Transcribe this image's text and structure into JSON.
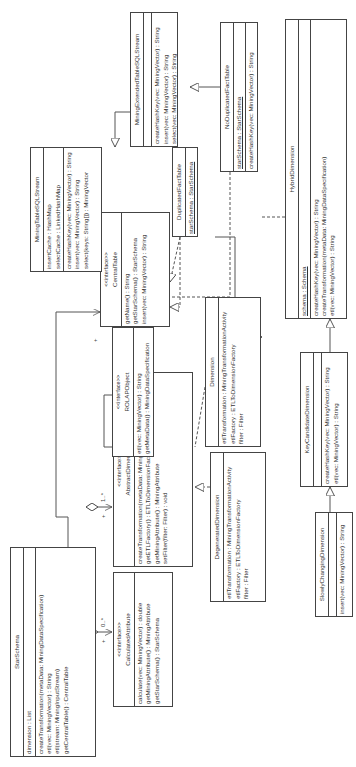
{
  "diagram": {
    "type": "uml-class-diagram",
    "orientation": "rotated-90-ccw",
    "classes": {
      "star_schema": {
        "name": "StarSchema",
        "attributes": [
          "dimension : List"
        ],
        "methods": [
          "createTransformation(metaData: MiningDataSpecification)",
          "etl(vec: MiningVector) : String",
          "etl(stream: MiningInputStream)",
          "getCentralTable() : CentralTable"
        ]
      },
      "calculated_attribute": {
        "stereotype": "<<interface>>",
        "name": "CalculatedAttribute",
        "methods": [
          "calculate(vec: MiningVector) : double",
          "getMiningAttribute() : MiningAttribute",
          "getStarSchema() : StarSchema"
        ]
      },
      "abstract_dimension": {
        "stereotype": "<<interface>>",
        "name": "AbstractDimension",
        "methods": [
          "createTransformation(metaData: MiningDataSpecification)",
          "getETLFactory() : ETLToDimensionFactory",
          "getMiningAttribute() : MiningAttribute",
          "setFilter(filter: Filter) : void"
        ]
      },
      "rolap_object": {
        "stereotype": "<<interface>>",
        "name": "ROLAPObject",
        "methods": [
          "etl(vec: MiningVector) : String",
          "getMetaData() : MiningDataSpecification"
        ]
      },
      "central_table": {
        "stereotype": "<<interface>>",
        "name": "CentralTable",
        "methods": [
          "getName() : String",
          "getStarSchema() : StarSchema",
          "insert(vec: MiningVector) : String"
        ]
      },
      "mining_table_sql_stream": {
        "name": "MiningTableSQLStream",
        "attributes": [
          "insertCache : HashMap",
          "selectCache : LinkedHashMap"
        ],
        "methods": [
          "createHashKey(vec: MiningVector) : String",
          "insert(vec: MiningVector) : String",
          "select(keys: String[]) : MiningVector"
        ]
      },
      "mining_extended_table_sql_stream": {
        "name": "MiningExtendedTableSQLStream",
        "attributes": [],
        "methods": [
          "createHashKey(vec: MiningVector) : String",
          "insert(vec: MiningVector) : String",
          "select(vec: MiningVector) : String"
        ]
      },
      "duplicated_fact_table": {
        "name": "DuplicatedFactTable",
        "attributes": [
          "starSchema : StarSchema"
        ]
      },
      "no_duplicated_fact_table": {
        "name": "NoDuplicatedFactTable",
        "attributes": [
          "starSchema : StarSchema"
        ],
        "methods": [
          "createHashKey(vec: MiningVector) : String"
        ]
      },
      "dimension": {
        "name": "Dimension",
        "attributes": [
          "etlTransformation : MiningTransformationActivity",
          "etlFactory : ETLToDimensionFactory",
          "filter : Filter"
        ]
      },
      "degenerated_dimension": {
        "name": "DegeneratedDimension",
        "attributes": [
          "etlTransformation : MiningTransformationActivity",
          "etlFactory : ETLToDimensionFactory",
          "filter : Filter"
        ]
      },
      "hybrid_dimension": {
        "name": "HybridDimension",
        "attributes": [
          "schema : Schema"
        ],
        "methods": [
          "createHashKey(vec: MiningVector) : String",
          "createTransformation(metaData: MiningDataSpecification)",
          "etl(vec: MiningVector) : String"
        ]
      },
      "key_candidate_dimension": {
        "name": "KeyCandidateDimension",
        "attributes": [],
        "methods": [
          "createHashKey(vec: MiningVector) : String",
          "etl(vec: MiningVector) : String"
        ]
      },
      "slowly_changing_dimension": {
        "name": "SlowlyChangingDimension",
        "attributes": [],
        "methods": [
          "insert(vec: MiningVector) : String"
        ]
      }
    },
    "multiplicities": {
      "calc": "0..*",
      "calc_end": "+",
      "dim": "1..*",
      "dim_end": "+",
      "central": "+",
      "central_end": "1"
    }
  }
}
